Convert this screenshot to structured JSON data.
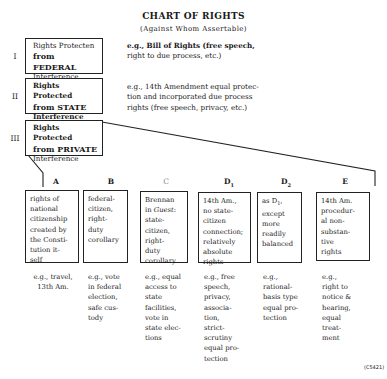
{
  "header": {
    "title": "CHART OF RIGHTS",
    "subtitle": "(Against Whom Assertable)"
  },
  "levels": [
    {
      "numeral": "I",
      "label_lines": [
        "Rights Protecten",
        "from FEDERAL",
        "Interference"
      ],
      "example_lines": [
        "e.g., Bill of Rights (free speech,",
        "right to due process, etc.)"
      ]
    },
    {
      "numeral": "II",
      "label_lines": [
        "Rights Protected",
        "from STATE",
        "Interference"
      ],
      "example_lines": [
        "e.g., 14th Amendment equal protec-",
        "tion and incorporated due process",
        "rights (free speech, privacy, etc.)"
      ]
    },
    {
      "numeral": "III",
      "label_lines": [
        "Rights Protected",
        "from PRIVATE",
        "Interference"
      ]
    }
  ],
  "columns": [
    {
      "header": "A",
      "box": "rights of\nnational\ncitizenship\ncreated by\nthe Consti-\ntution it-\nself",
      "example": "e.g., travel,\n13th Am."
    },
    {
      "header": "B",
      "box": "federal-\ncitizen,\nright-\nduty\ncorollary",
      "example": "e.g., vote\nin federal\nelection,\nsafe cus-\ntody"
    },
    {
      "header": "C",
      "box_pre": "Brennan\nin ",
      "box_italic": "Guest",
      "box_post": ":\nstate-\ncitizen,\nright-\nduty\ncorollary",
      "example": "e.g., equal\naccess to\nstate\nfacilities,\nvote in\nstate elec-\ntions"
    },
    {
      "header": "D",
      "header_sub": "1",
      "box": "14th Am.,\nno state-\ncitizen\nconnection;\nrelatively\nabsolute\nrights",
      "example": "e.g., free\nspeech,\nprivacy,\nassocia-\ntion,\nstrict-\nscrutiny\nequal pro-\ntection"
    },
    {
      "header": "D",
      "header_sub": "2",
      "box_pre": "as D",
      "box_sub": "1",
      "box_post": ",\nexcept\nmore\nreadily\nbalanced",
      "example": "e.g.,\nrational-\nbasis type\nequal pro-\ntection"
    },
    {
      "header": "E",
      "box": "14th Am.\nprocedur-\nal non-\nsubstan-\ntive\nrights",
      "example": "e.g.,\nright to\nnotice &\nhearing,\nequal\ntreat-\nment"
    }
  ],
  "reference_code": "(C5421)",
  "colors": {
    "ink": "#1a1a1a",
    "border": "#222222",
    "background": "#ffffff"
  }
}
